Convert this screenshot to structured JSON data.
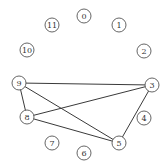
{
  "graph": {
    "nodes": [
      {
        "id": 0,
        "label": "0"
      },
      {
        "id": 1,
        "label": "1"
      },
      {
        "id": 2,
        "label": "2"
      },
      {
        "id": 3,
        "label": "3"
      },
      {
        "id": 4,
        "label": "4"
      },
      {
        "id": 5,
        "label": "5"
      },
      {
        "id": 6,
        "label": "6"
      },
      {
        "id": 7,
        "label": "7"
      },
      {
        "id": 8,
        "label": "8"
      },
      {
        "id": 9,
        "label": "9"
      },
      {
        "id": 10,
        "label": "10"
      },
      {
        "id": 11,
        "label": "11"
      }
    ],
    "edges": [
      {
        "source": 9,
        "target": 3
      },
      {
        "source": 9,
        "target": 8
      },
      {
        "source": 9,
        "target": 5
      },
      {
        "source": 8,
        "target": 3
      },
      {
        "source": 8,
        "target": 5
      },
      {
        "source": 3,
        "target": 5
      }
    ],
    "layout": "circular"
  }
}
